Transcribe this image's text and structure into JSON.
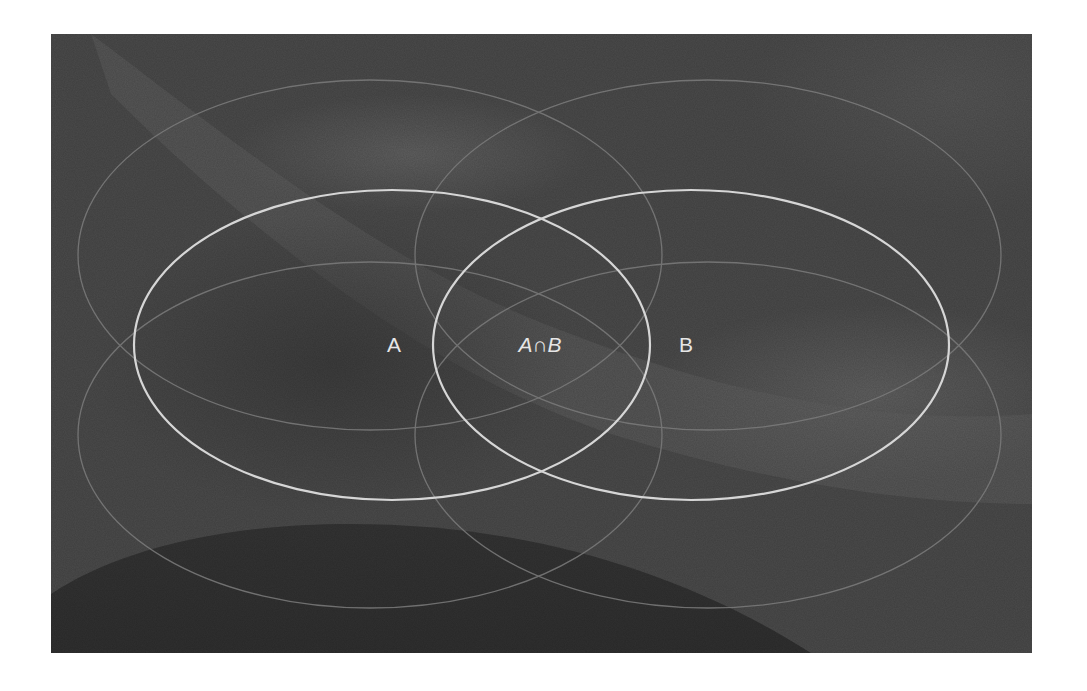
{
  "diagram": {
    "type": "venn",
    "title": "",
    "sets": [
      {
        "id": "A",
        "label": "A"
      },
      {
        "id": "B",
        "label": "B"
      }
    ],
    "intersection": {
      "label": "A∩B",
      "left": "A",
      "symbol": "∩",
      "right": "B"
    },
    "colors": {
      "background": "#4b4b4b",
      "background_light": "#5e5e5e",
      "background_dark": "#363636",
      "primary_stroke": "#d6d6d6",
      "faint_stroke": "#7c7c7c",
      "label_text": "#e6e6e6",
      "page": "#ffffff"
    },
    "primary_ellipses": [
      {
        "name": "A",
        "cx": 341,
        "cy": 311,
        "rx": 258,
        "ry": 155
      },
      {
        "name": "B",
        "cx": 640,
        "cy": 311,
        "rx": 258,
        "ry": 155
      }
    ],
    "faint_ellipses": [
      {
        "name": "top-left",
        "cx": 319,
        "cy": 221,
        "rx": 292,
        "ry": 175
      },
      {
        "name": "top-right",
        "cx": 657,
        "cy": 221,
        "rx": 293,
        "ry": 175
      },
      {
        "name": "bottom-left",
        "cx": 319,
        "cy": 401,
        "rx": 292,
        "ry": 173
      },
      {
        "name": "bottom-right",
        "cx": 657,
        "cy": 401,
        "rx": 293,
        "ry": 173
      }
    ]
  }
}
